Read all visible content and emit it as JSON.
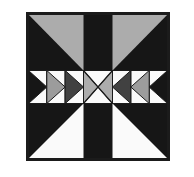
{
  "figure": {
    "type": "quilt-block-pattern",
    "middle_row_sequence": [
      "black-arrow-right",
      "gray-arrow-right",
      "darkgray-arrow-right",
      "hourglass-center",
      "darkgray-arrow-left",
      "gray-arrow-left",
      "black-arrow-left"
    ],
    "colors": {
      "page_bg": "#ffffff",
      "black": "#161616",
      "gray_light": "#acacac",
      "gray_medium": "#9c9c9c",
      "gray_dark": "#414141",
      "white_piece": "#fafafa",
      "outline": "#1b1b1b"
    }
  }
}
